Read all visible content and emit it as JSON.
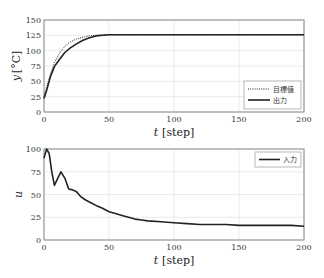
{
  "chart_data": [
    {
      "type": "line",
      "title": "",
      "xlabel": "t [step]",
      "ylabel": "y [°C]",
      "xlim": [
        0,
        200
      ],
      "ylim": [
        0,
        150
      ],
      "xticks": [
        "0",
        "50",
        "100",
        "150",
        "200"
      ],
      "yticks": [
        "0",
        "25",
        "50",
        "75",
        "100",
        "125",
        "150"
      ],
      "grid": true,
      "legend_position": "lower right",
      "series": [
        {
          "name": "目標値",
          "style": "dotted",
          "x": [
            0,
            2,
            5,
            8,
            12,
            16,
            20,
            25,
            30,
            35,
            40,
            50,
            60,
            100,
            150,
            200
          ],
          "values": [
            25,
            40,
            62,
            80,
            96,
            107,
            114,
            119,
            122,
            124,
            125,
            126,
            126,
            126,
            126,
            126
          ]
        },
        {
          "name": "出力",
          "style": "solid",
          "x": [
            0,
            2,
            5,
            8,
            12,
            16,
            20,
            25,
            30,
            35,
            40,
            45,
            50,
            60,
            100,
            150,
            200
          ],
          "values": [
            22,
            35,
            58,
            74,
            86,
            97,
            104,
            111,
            117,
            121,
            124,
            125,
            126,
            126,
            126,
            126,
            126
          ]
        }
      ]
    },
    {
      "type": "line",
      "title": "",
      "xlabel": "t [step]",
      "ylabel": "u",
      "xlim": [
        0,
        200
      ],
      "ylim": [
        0,
        100
      ],
      "xticks": [
        "0",
        "50",
        "100",
        "150",
        "200"
      ],
      "yticks": [
        "0",
        "25",
        "50",
        "75",
        "100"
      ],
      "grid": true,
      "legend_position": "upper right",
      "series": [
        {
          "name": "入力",
          "style": "solid",
          "x": [
            0,
            2,
            4,
            6,
            8,
            10,
            13,
            16,
            19,
            22,
            25,
            28,
            32,
            36,
            40,
            45,
            50,
            55,
            60,
            65,
            70,
            75,
            80,
            90,
            100,
            110,
            120,
            130,
            140,
            150,
            160,
            170,
            180,
            190,
            200
          ],
          "values": [
            90,
            100,
            95,
            75,
            60,
            66,
            75,
            68,
            56,
            55,
            53,
            48,
            44,
            41,
            38,
            35,
            31,
            29,
            27,
            25,
            23,
            22,
            21,
            20,
            19,
            18,
            17,
            17,
            17,
            16,
            16,
            16,
            16,
            16,
            15
          ]
        }
      ]
    }
  ],
  "legend_top": {
    "target": "目標値",
    "output": "出力"
  },
  "legend_bottom": {
    "input": "入力"
  },
  "axis": {
    "top_ylabel_var": "y",
    "top_ylabel_unit": "[°C]",
    "bottom_ylabel": "u",
    "xlabel_var": "t",
    "xlabel_unit": "[step]"
  }
}
